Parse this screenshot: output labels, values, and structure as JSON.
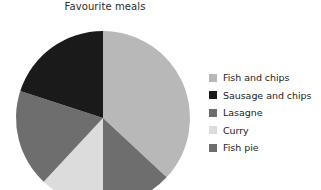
{
  "chart_data": {
    "type": "pie",
    "title": "Favourite meals",
    "xlabel": "",
    "ylabel": "",
    "legend_position": "right",
    "grid": false,
    "start_angle_deg": 0,
    "direction": "clockwise",
    "categories": [
      "Fish and chips",
      "Sausage and chips",
      "Lasagne",
      "Curry",
      "Fish pie"
    ],
    "values": [
      37,
      20,
      18,
      12,
      13
    ],
    "value_unit": "percent",
    "colors": [
      "#b8b8b8",
      "#1a1a1a",
      "#6e6e6e",
      "#dcdcdc",
      "#6e6e6e"
    ],
    "slices": [
      {
        "label": "Fish and chips",
        "value": 37,
        "color": "#b8b8b8",
        "start_deg": 0,
        "end_deg": 133
      },
      {
        "label": "Fish pie",
        "value": 13,
        "color": "#6e6e6e",
        "start_deg": 133,
        "end_deg": 180
      },
      {
        "label": "Curry",
        "value": 12,
        "color": "#dcdcdc",
        "start_deg": 180,
        "end_deg": 223
      },
      {
        "label": "Lasagne",
        "value": 18,
        "color": "#6e6e6e",
        "start_deg": 223,
        "end_deg": 288
      },
      {
        "label": "Sausage and chips",
        "value": 20,
        "color": "#1a1a1a",
        "start_deg": 288,
        "end_deg": 360
      }
    ],
    "geometry": {
      "cx": 103,
      "cy": 118,
      "r": 87
    }
  },
  "legend": {
    "items": [
      {
        "label": "Fish and chips",
        "color": "#b8b8b8"
      },
      {
        "label": "Sausage and chips",
        "color": "#1a1a1a"
      },
      {
        "label": "Lasagne",
        "color": "#6e6e6e"
      },
      {
        "label": "Curry",
        "color": "#dcdcdc"
      },
      {
        "label": "Fish pie",
        "color": "#6e6e6e"
      }
    ]
  }
}
